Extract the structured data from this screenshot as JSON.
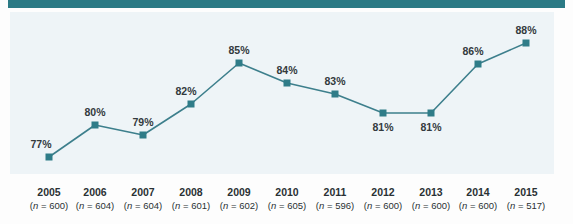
{
  "colors": {
    "accent": "#2b7a85",
    "line": "#3d7f8c",
    "marker": "#2f7c88",
    "plot_background": "#eef4f7",
    "label_text": "#333a3d",
    "page_background": "#fdfdfd"
  },
  "top_rule": {
    "name": "top-rule",
    "color": "#2b7a85"
  },
  "chart_data": {
    "type": "line",
    "title": "",
    "subtitle": "",
    "xlabel": "",
    "ylabel": "",
    "grid": false,
    "legend": null,
    "ylim": [
      74,
      90
    ],
    "categories": [
      "2005",
      "2006",
      "2007",
      "2008",
      "2009",
      "2010",
      "2011",
      "2012",
      "2013",
      "2014",
      "2015"
    ],
    "values": [
      77,
      80,
      79,
      82,
      85,
      84,
      83,
      81,
      81,
      86,
      88
    ],
    "point_labels": [
      "77%",
      "80%",
      "79%",
      "82%",
      "85%",
      "84%",
      "83%",
      "81%",
      "81%",
      "86%",
      "88%"
    ],
    "sample_sizes": [
      600,
      604,
      604,
      601,
      602,
      605,
      596,
      600,
      600,
      600,
      517
    ],
    "tick_sublabels": [
      "(n = 600)",
      "(n = 604)",
      "(n = 604)",
      "(n = 601)",
      "(n = 600)",
      "(n = 605)",
      "(n = 596)",
      "(n = 600)",
      "(n = 600)",
      "(n = 600)",
      "(n = 517)"
    ],
    "label_positions": [
      "above",
      "above",
      "above",
      "above",
      "above",
      "above",
      "above",
      "below",
      "below",
      "above",
      "above"
    ],
    "series_name": ""
  },
  "points": [
    {
      "x": 49,
      "y": 157,
      "label": "77%",
      "label_x": 41,
      "label_y": 138,
      "year": "2005",
      "n_text": "(n = 600)"
    },
    {
      "x": 95,
      "y": 125,
      "label": "80%",
      "label_x": 95,
      "label_y": 106,
      "year": "2006",
      "n_text": "(n = 604)"
    },
    {
      "x": 143,
      "y": 135,
      "label": "79%",
      "label_x": 143,
      "label_y": 116,
      "year": "2007",
      "n_text": "(n = 604)"
    },
    {
      "x": 191,
      "y": 104,
      "label": "82%",
      "label_x": 186,
      "label_y": 85,
      "year": "2008",
      "n_text": "(n = 601)"
    },
    {
      "x": 239,
      "y": 63,
      "label": "85%",
      "label_x": 239,
      "label_y": 44,
      "year": "2009",
      "n_text": "(n = 602)"
    },
    {
      "x": 287,
      "y": 83,
      "label": "84%",
      "label_x": 287,
      "label_y": 64,
      "year": "2010",
      "n_text": "(n = 605)"
    },
    {
      "x": 335,
      "y": 94,
      "label": "83%",
      "label_x": 335,
      "label_y": 75,
      "year": "2011",
      "n_text": "(n = 596)"
    },
    {
      "x": 383,
      "y": 113,
      "label": "81%",
      "label_x": 383,
      "label_y": 121,
      "year": "2012",
      "n_text": "(n = 600)"
    },
    {
      "x": 431,
      "y": 113,
      "label": "81%",
      "label_x": 431,
      "label_y": 121,
      "year": "2013",
      "n_text": "(n = 600)"
    },
    {
      "x": 478,
      "y": 64,
      "label": "86%",
      "label_x": 473,
      "label_y": 45,
      "year": "2014",
      "n_text": "(n = 600)"
    },
    {
      "x": 526,
      "y": 43,
      "label": "88%",
      "label_x": 526,
      "label_y": 24,
      "year": "2015",
      "n_text": "(n = 517)"
    }
  ]
}
